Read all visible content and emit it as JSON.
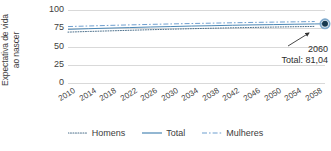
{
  "chart_data": {
    "type": "line",
    "title": "",
    "subtitle": "",
    "xlabel": "",
    "ylabel": "Expectativa de vida ao nascer",
    "ylabel_line1": "Expectativa de vida",
    "ylabel_line2": "ao nascer",
    "ylim": [
      0,
      100
    ],
    "yticks": [
      "0",
      "25",
      "50",
      "75",
      "100"
    ],
    "ytick_values": [
      0,
      25,
      50,
      75,
      100
    ],
    "grid": true,
    "grid_color": "#d9d9d9",
    "legend_position": "bottom",
    "x": [
      2010,
      2014,
      2018,
      2022,
      2026,
      2030,
      2034,
      2038,
      2042,
      2046,
      2050,
      2054,
      2058
    ],
    "categories": [
      "2010",
      "2014",
      "2018",
      "2022",
      "2026",
      "2030",
      "2034",
      "2038",
      "2042",
      "2046",
      "2050",
      "2054",
      "2058"
    ],
    "xlim": [
      2010,
      2060
    ],
    "series": [
      {
        "name": "Homens",
        "style": "dotted",
        "color": "#4a6e8a",
        "values": [
          69.7,
          70.6,
          71.4,
          72.2,
          73.0,
          73.7,
          74.4,
          75.0,
          75.6,
          76.1,
          76.6,
          77.1,
          77.5
        ]
      },
      {
        "name": "Total",
        "style": "solid",
        "color": "#4b87b5",
        "values": [
          73.5,
          74.4,
          75.2,
          75.9,
          76.7,
          77.3,
          78.0,
          78.5,
          79.1,
          79.6,
          80.0,
          80.5,
          80.9
        ]
      },
      {
        "name": "Mulheres",
        "style": "dash-dot",
        "color": "#6f9fd0",
        "values": [
          77.3,
          78.1,
          78.9,
          79.6,
          80.3,
          80.9,
          81.5,
          82.0,
          82.5,
          83.0,
          83.4,
          83.8,
          84.2
        ]
      }
    ],
    "annotation": {
      "year": "2060",
      "value_label": "Total: 81,04",
      "marker_x": 2060,
      "marker_y": 81.04,
      "marker_color": "#16384f",
      "marker_ring_color": "#7fa9cc"
    }
  },
  "legend": {
    "items": [
      {
        "label": "Homens",
        "style": "dotted",
        "color": "#4a6e8a"
      },
      {
        "label": "Total",
        "style": "solid",
        "color": "#4b87b5"
      },
      {
        "label": "Mulheres",
        "style": "dash-dot",
        "color": "#6f9fd0"
      }
    ]
  }
}
